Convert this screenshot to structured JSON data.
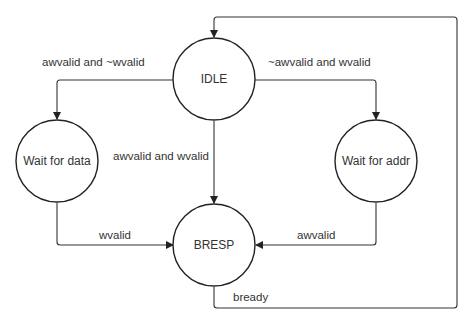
{
  "diagram": {
    "type": "state-machine",
    "states": [
      {
        "id": "idle",
        "label": "IDLE",
        "cx": 214,
        "cy": 79
      },
      {
        "id": "wait_data",
        "label": "Wait for data",
        "cx": 57,
        "cy": 161
      },
      {
        "id": "wait_addr",
        "label": "Wait for addr",
        "cx": 376,
        "cy": 161
      },
      {
        "id": "bresp",
        "label": "BRESP",
        "cx": 214,
        "cy": 245
      }
    ],
    "transitions": [
      {
        "id": "idle_to_wait_data",
        "from": "IDLE",
        "to": "Wait for data",
        "label": "awvalid and ~wvalid"
      },
      {
        "id": "idle_to_wait_addr",
        "from": "IDLE",
        "to": "Wait for addr",
        "label": "~awvalid and wvalid"
      },
      {
        "id": "idle_to_bresp",
        "from": "IDLE",
        "to": "BRESP",
        "label": "awvalid and wvalid"
      },
      {
        "id": "wait_data_to_bresp",
        "from": "Wait for data",
        "to": "BRESP",
        "label": "wvalid"
      },
      {
        "id": "wait_addr_to_bresp",
        "from": "Wait for addr",
        "to": "BRESP",
        "label": "awvalid"
      },
      {
        "id": "bresp_to_idle",
        "from": "BRESP",
        "to": "IDLE",
        "label": "bready"
      }
    ],
    "colors": {
      "stroke": "#222222",
      "text": "#333333",
      "background": "#ffffff"
    }
  }
}
